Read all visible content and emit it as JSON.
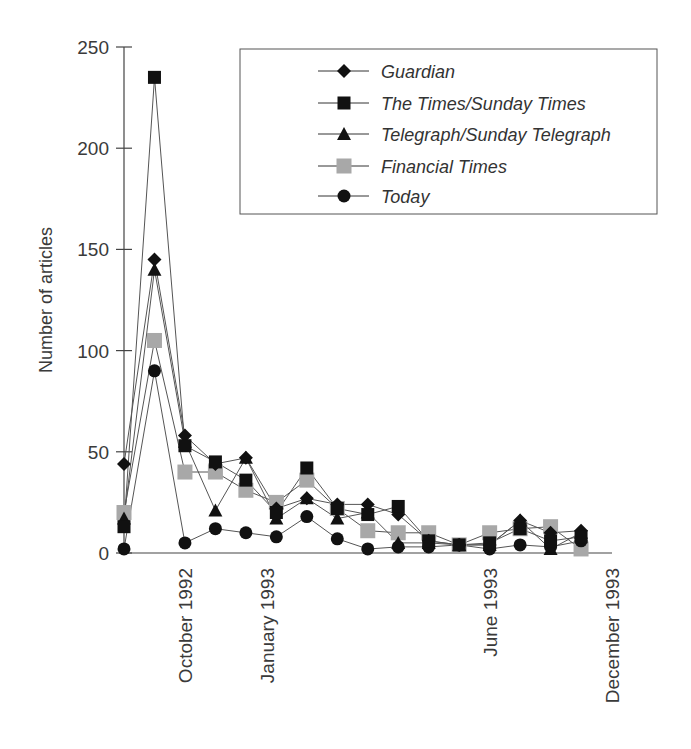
{
  "chart_data": {
    "type": "line",
    "title": "",
    "xlabel": "",
    "ylabel": "Number of articles",
    "ylim": [
      0,
      250
    ],
    "yticks": [
      0,
      50,
      100,
      150,
      200,
      250
    ],
    "grid": false,
    "legend_position": "upper right (inside)",
    "x_tick_labels": [
      {
        "label": "October 1992",
        "index": 2
      },
      {
        "label": "January 1993",
        "index": 4.7
      },
      {
        "label": "June 1993",
        "index": 12
      },
      {
        "label": "December 1993",
        "index": 16
      }
    ],
    "x": [
      0,
      1,
      2,
      3,
      4,
      5,
      6,
      7,
      8,
      9,
      10,
      11,
      12,
      13,
      14,
      15
    ],
    "series": [
      {
        "name": "Guardian",
        "marker": "diamond",
        "color": "#111111",
        "values": [
          44,
          145,
          58,
          44,
          47,
          22,
          27,
          24,
          24,
          19,
          6,
          4,
          4,
          16,
          10,
          11
        ]
      },
      {
        "name": "The Times/Sunday Times",
        "marker": "square",
        "color": "#111111",
        "values": [
          13,
          235,
          53,
          45,
          36,
          20,
          42,
          22,
          19,
          23,
          6,
          4,
          5,
          12,
          6,
          8
        ]
      },
      {
        "name": "Telegraph/Sunday Telegraph",
        "marker": "triangle",
        "color": "#111111",
        "values": [
          17,
          140,
          55,
          21,
          47,
          17,
          27,
          17,
          20,
          5,
          5,
          4,
          4,
          16,
          2,
          10
        ]
      },
      {
        "name": "Financial Times",
        "marker": "square",
        "color": "#a8a8a8",
        "values": [
          20,
          105,
          40,
          40,
          31,
          25,
          36,
          22,
          11,
          10,
          10,
          4,
          10,
          12,
          13,
          2
        ]
      },
      {
        "name": "Today",
        "marker": "circle",
        "color": "#111111",
        "values": [
          2,
          90,
          5,
          12,
          10,
          8,
          18,
          7,
          2,
          3,
          3,
          4,
          2,
          4,
          3,
          6
        ]
      }
    ]
  },
  "legend": {
    "items": [
      {
        "label": "Guardian"
      },
      {
        "label": "The Times/Sunday Times"
      },
      {
        "label": "Telegraph/Sunday Telegraph"
      },
      {
        "label": "Financial Times"
      },
      {
        "label": "Today"
      }
    ]
  }
}
